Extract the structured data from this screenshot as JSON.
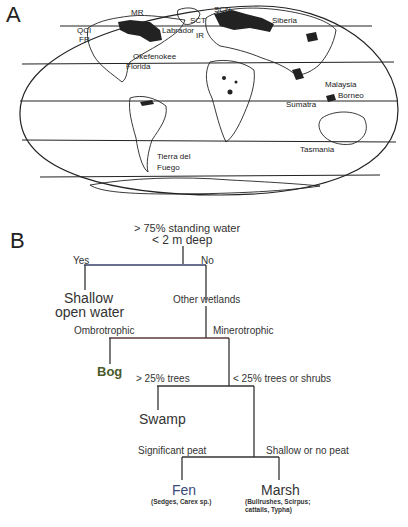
{
  "panel_a": {
    "label": "A",
    "map_labels": [
      {
        "text": "MR",
        "x": 131,
        "y": 12
      },
      {
        "text": "HB",
        "x": 140,
        "y": 26
      },
      {
        "text": "Labrador",
        "x": 162,
        "y": 30
      },
      {
        "text": "SCT",
        "x": 190,
        "y": 20
      },
      {
        "text": "IR",
        "x": 196,
        "y": 35
      },
      {
        "text": "SCN",
        "x": 214,
        "y": 9
      },
      {
        "text": "Siberia",
        "x": 272,
        "y": 20
      },
      {
        "text": "QCI",
        "x": 77,
        "y": 30
      },
      {
        "text": "FR",
        "x": 79,
        "y": 39
      },
      {
        "text": "Okefenokee",
        "x": 133,
        "y": 56
      },
      {
        "text": "Florida",
        "x": 126,
        "y": 66
      },
      {
        "text": "Malaysia",
        "x": 325,
        "y": 84
      },
      {
        "text": "Borneo",
        "x": 338,
        "y": 95
      },
      {
        "text": "Sumatra",
        "x": 286,
        "y": 104
      },
      {
        "text": "Tasmania",
        "x": 300,
        "y": 149
      },
      {
        "text": "Tierra del",
        "x": 157,
        "y": 156
      },
      {
        "text": "Fuego",
        "x": 157,
        "y": 167
      }
    ]
  },
  "panel_b": {
    "label": "B",
    "root_line1": "> 75% standing water",
    "root_line2": "< 2 m deep",
    "yes": "Yes",
    "no": "No",
    "shallow_line1": "Shallow",
    "shallow_line2": "open water",
    "other_wetlands": "Other wetlands",
    "ombrotrophic": "Ombrotrophic",
    "minerotrophic": "Minerotrophic",
    "bog": "Bog",
    "gt25_trees": "> 25% trees",
    "lt25_trees": "< 25% trees or shrubs",
    "swamp": "Swamp",
    "significant_peat": "Significant peat",
    "shallow_no_peat": "Shallow or no peat",
    "fen": "Fen",
    "fen_note": "(Sedges, Carex sp.)",
    "marsh": "Marsh",
    "marsh_note_line1": "(Bullrushes, Scirpus;",
    "marsh_note_line2": "cattails, Typha)"
  }
}
